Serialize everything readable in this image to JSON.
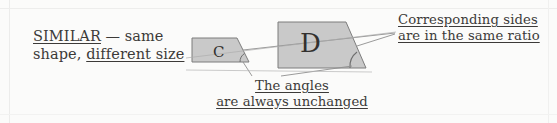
{
  "figure": {
    "kind": "geometry-annotation-diagram",
    "width": 557,
    "height": 123,
    "background_color": "#fbfbfa",
    "shape_fill_color": "#c9c9c9",
    "shape_stroke_color": "#7a7a7a",
    "leader_line_color": "#8c8c8c",
    "text_color": "#3c3a38"
  },
  "definition": {
    "term": "SIMILAR",
    "dash": " — ",
    "line1_rest": "same",
    "line2_plain": "shape, ",
    "line2_underlined": "different size"
  },
  "callouts": {
    "sides": {
      "line1": "Corresponding sides",
      "line2": "are in the same ratio"
    },
    "angles": {
      "line1": "The angles",
      "line2": "are always unchanged"
    }
  },
  "shapes": [
    {
      "label": "C",
      "name": "small-trapezoid"
    },
    {
      "label": "D",
      "name": "large-trapezoid"
    }
  ]
}
